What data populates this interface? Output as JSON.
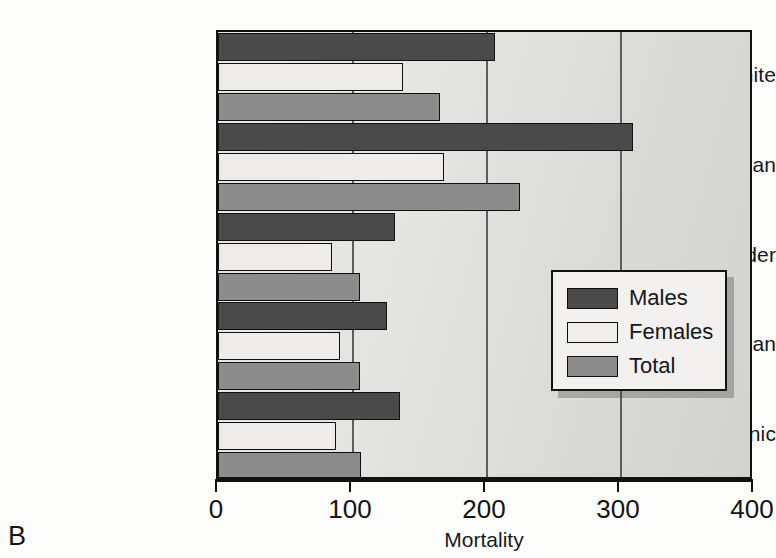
{
  "panel": {
    "letter": "B"
  },
  "chart_data": {
    "type": "bar",
    "orientation": "horizontal",
    "title": "",
    "xlabel": "Mortality",
    "ylabel": "",
    "xlim": [
      0,
      400
    ],
    "xticks": [
      0,
      100,
      200,
      300,
      400
    ],
    "xtick_labels": [
      "0",
      "100",
      "200",
      "300",
      "400"
    ],
    "grid": "vertical",
    "legend_position": "center-right",
    "categories": [
      "White",
      "African American",
      "Asian/Pacific Islander",
      "American Indian",
      "Hispanic"
    ],
    "series": [
      {
        "name": "Males",
        "color": "#4a4a4a",
        "values": [
          207,
          310,
          132,
          126,
          136
        ]
      },
      {
        "name": "Females",
        "color": "#edecea",
        "values": [
          138,
          169,
          85,
          91,
          88
        ]
      },
      {
        "name": "Total",
        "color": "#8c8c8c",
        "values": [
          166,
          225,
          106,
          106,
          107
        ]
      }
    ]
  },
  "legend": {
    "items": [
      {
        "label": "Males",
        "key": "males"
      },
      {
        "label": "Females",
        "key": "females"
      },
      {
        "label": "Total",
        "key": "total"
      }
    ]
  }
}
